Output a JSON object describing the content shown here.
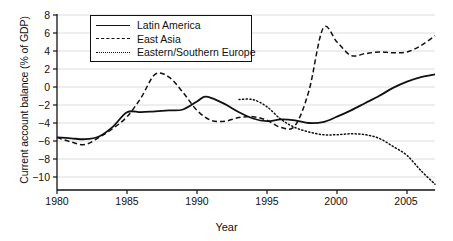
{
  "chart_data": {
    "type": "line",
    "title": "",
    "xlabel": "Year",
    "ylabel": "Current account balance (% of GDP)",
    "xlim": [
      1980,
      2007
    ],
    "ylim": [
      -11.5,
      8.8
    ],
    "xticks": [
      1980,
      1985,
      1990,
      1995,
      2000,
      2005
    ],
    "yticks": [
      -10,
      -8,
      -6,
      -4,
      -2,
      0,
      2,
      4,
      6,
      8
    ],
    "grid": "horizontal",
    "legend_position": "top-left",
    "series": [
      {
        "name": "Latin America",
        "style": "solid",
        "color": "#111111",
        "x": [
          1980,
          1981,
          1982,
          1983,
          1984,
          1985,
          1986,
          1987,
          1988,
          1989,
          1990,
          1990.5,
          1991,
          1992,
          1993,
          1994,
          1995,
          1996,
          1997,
          1998,
          1999,
          2000,
          2001,
          2002,
          2003,
          2004,
          2005,
          2006,
          2007
        ],
        "y": [
          -5.6,
          -5.7,
          -5.8,
          -5.5,
          -4.4,
          -2.8,
          -2.8,
          -2.7,
          -2.6,
          -2.5,
          -1.6,
          -1.1,
          -1.2,
          -1.9,
          -2.8,
          -3.5,
          -3.8,
          -3.6,
          -3.7,
          -4.0,
          -3.9,
          -3.3,
          -2.6,
          -1.8,
          -1.0,
          -0.1,
          0.6,
          1.1,
          1.4
        ]
      },
      {
        "name": "East Asia",
        "style": "dashed",
        "color": "#111111",
        "x": [
          1980,
          1981,
          1982,
          1983,
          1984,
          1985,
          1986,
          1987,
          1988,
          1989,
          1990,
          1991,
          1992,
          1993,
          1994,
          1995,
          1996,
          1997,
          1998,
          1999,
          2000,
          2001,
          2002,
          2003,
          2004,
          2005,
          2006,
          2007
        ],
        "y": [
          -5.6,
          -6.1,
          -6.4,
          -5.6,
          -4.6,
          -3.3,
          -1.2,
          1.4,
          1.1,
          -0.6,
          -2.6,
          -3.7,
          -3.8,
          -3.4,
          -3.3,
          -3.7,
          -4.5,
          -4.3,
          -0.4,
          6.5,
          5.0,
          3.5,
          3.7,
          3.9,
          3.8,
          3.9,
          4.6,
          5.7
        ]
      },
      {
        "name": "Eastern/Southern Europe",
        "style": "dotted",
        "color": "#111111",
        "x": [
          1993,
          1994,
          1995,
          1996,
          1997,
          1998,
          1999,
          2000,
          2001,
          2002,
          2003,
          2004,
          2005,
          2006,
          2007
        ],
        "y": [
          -1.4,
          -1.4,
          -2.2,
          -3.6,
          -4.5,
          -5.0,
          -5.3,
          -5.3,
          -5.2,
          -5.3,
          -5.7,
          -6.6,
          -7.6,
          -9.3,
          -10.8
        ]
      }
    ]
  },
  "axes": {
    "ylabel": "Current account balance (% of GDP)",
    "xlabel": "Year",
    "yticks": [
      "8",
      "6",
      "4",
      "2",
      "0",
      "−2",
      "−4",
      "−6",
      "−8",
      "−10"
    ],
    "xticks": [
      "1980",
      "1985",
      "1990",
      "1995",
      "2000",
      "2005"
    ]
  },
  "legend": {
    "entries": [
      {
        "label": "Latin America",
        "style": "solid"
      },
      {
        "label": "East Asia",
        "style": "dashed"
      },
      {
        "label": "Eastern/Southern Europe",
        "style": "dotted"
      }
    ]
  },
  "colors": {
    "ink": "#111111",
    "grid": "#e8e8e8",
    "background": "#ffffff"
  }
}
